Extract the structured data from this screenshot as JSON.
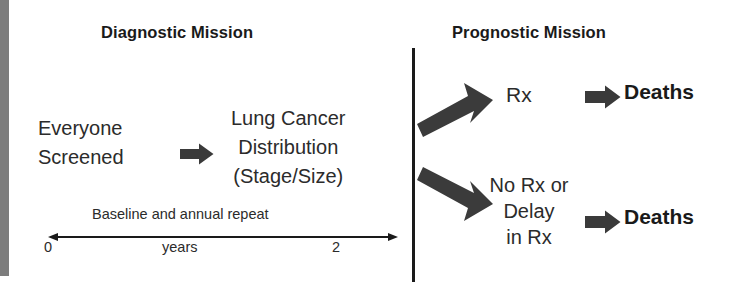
{
  "figure": {
    "left_edge_bar_color": "#7d7d7d",
    "background_color": "#ffffff",
    "ink_color": "#231f20"
  },
  "diagnostic": {
    "heading": "Diagnostic Mission",
    "population_label": "Everyone\nScreened",
    "population_line1": "Everyone",
    "population_line2": "Screened",
    "outcome_line1": "Lung Cancer",
    "outcome_line2": "Distribution",
    "outcome_line3": "(Stage/Size)",
    "flow_arrow_icon": "block-right-arrow-icon"
  },
  "timeline": {
    "top_label": "Baseline and annual repeat",
    "unit_label": "years",
    "tick_start": "0",
    "tick_end": "2",
    "axis_icon": "double-headed-arrow-icon"
  },
  "prognostic": {
    "heading": "Prognostic Mission",
    "divider_icon": "vertical-divider-icon",
    "branches": [
      {
        "branch_arrow_icon": "thick-diagonal-up-arrow-icon",
        "treatment_label": "Rx",
        "result_arrow_icon": "block-right-arrow-icon",
        "result_label": "Deaths"
      },
      {
        "branch_arrow_icon": "thick-diagonal-down-arrow-icon",
        "treatment_label": "No Rx or\nDelay\nin Rx",
        "treatment_line1": "No Rx or",
        "treatment_line2": "Delay",
        "treatment_line3": "in Rx",
        "result_arrow_icon": "block-right-arrow-icon",
        "result_label": "Deaths"
      }
    ]
  }
}
